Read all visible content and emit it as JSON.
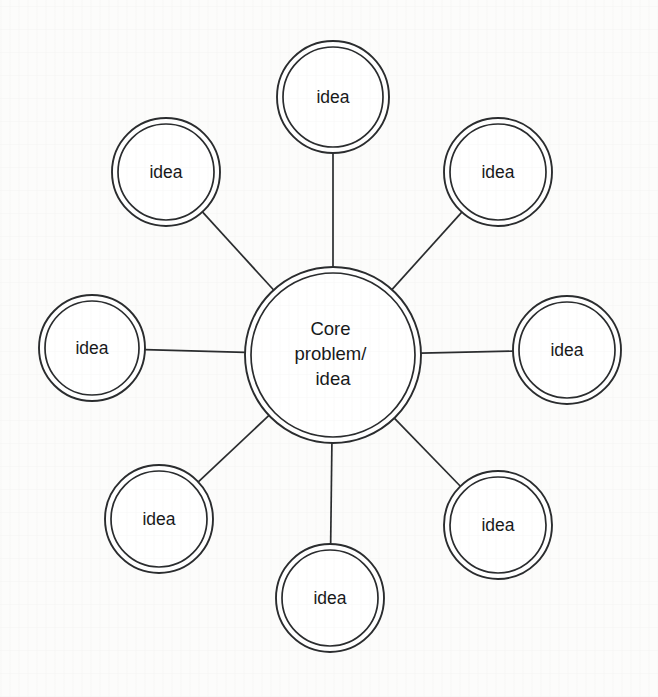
{
  "diagram": {
    "type": "radial-mind-map",
    "background_color": "#fcfcfb",
    "stroke_color": "#2a2c2e",
    "text_color": "#17191a",
    "canvas": {
      "width": 658,
      "height": 697
    },
    "center_node": {
      "label_line_1": "Core",
      "label_line_2": "problem/",
      "label_line_3": "idea",
      "cx": 333,
      "cy": 355,
      "r_outer": 88,
      "r_inner": 82
    },
    "satellite_nodes": [
      {
        "label": "idea",
        "cx": 333,
        "cy": 97,
        "r_outer": 56,
        "r_inner": 50,
        "position": "top"
      },
      {
        "label": "idea",
        "cx": 498,
        "cy": 172,
        "r_outer": 54,
        "r_inner": 48,
        "position": "top-right"
      },
      {
        "label": "idea",
        "cx": 567,
        "cy": 350,
        "r_outer": 54,
        "r_inner": 48,
        "position": "right"
      },
      {
        "label": "idea",
        "cx": 498,
        "cy": 525,
        "r_outer": 54,
        "r_inner": 48,
        "position": "bottom-right"
      },
      {
        "label": "idea",
        "cx": 330,
        "cy": 598,
        "r_outer": 54,
        "r_inner": 48,
        "position": "bottom"
      },
      {
        "label": "idea",
        "cx": 159,
        "cy": 519,
        "r_outer": 54,
        "r_inner": 48,
        "position": "bottom-left"
      },
      {
        "label": "idea",
        "cx": 92,
        "cy": 348,
        "r_outer": 53,
        "r_inner": 47,
        "position": "left"
      },
      {
        "label": "idea",
        "cx": 166,
        "cy": 172,
        "r_outer": 54,
        "r_inner": 48,
        "position": "top-left"
      }
    ],
    "connectors": [
      {
        "from": "center",
        "to": "top"
      },
      {
        "from": "center",
        "to": "top-right"
      },
      {
        "from": "center",
        "to": "right"
      },
      {
        "from": "center",
        "to": "bottom-right"
      },
      {
        "from": "center",
        "to": "bottom"
      },
      {
        "from": "center",
        "to": "bottom-left"
      },
      {
        "from": "center",
        "to": "left"
      },
      {
        "from": "center",
        "to": "top-left"
      }
    ]
  }
}
